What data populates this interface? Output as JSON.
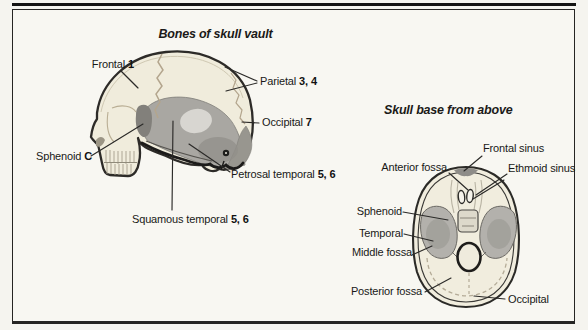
{
  "header": {
    "fragment": "Skull bones"
  },
  "left": {
    "title": "Bones of skull vault",
    "labels": {
      "frontal": {
        "name": "Frontal",
        "num": "1"
      },
      "parietal": {
        "name": "Parietal",
        "num": "3, 4"
      },
      "occipital": {
        "name": "Occipital",
        "num": "7"
      },
      "sphenoid": {
        "name": "Sphenoid",
        "num": "C"
      },
      "petrosal": {
        "name": "Petrosal temporal",
        "num": "5, 6"
      },
      "squamous": {
        "name": "Squamous temporal",
        "num": "5, 6"
      }
    }
  },
  "right": {
    "title": "Skull base from above",
    "labels": {
      "anterior": "Anterior fossa",
      "frontal_sinus": "Frontal sinus",
      "ethmoid": "Ethmoid sinus",
      "sphenoid": "Sphenoid",
      "temporal": "Temporal",
      "middle": "Middle fossa",
      "posterior": "Posterior fossa",
      "occipital": "Occipital"
    }
  },
  "colors": {
    "paper": "#f5f4ef",
    "ink": "#1b1a18",
    "bone_cream": "#f0ecdc",
    "temporal_gray": "#a9a7a2",
    "occipital_gray": "#98968f",
    "fossa_gray": "#b3b1ac",
    "suture_tan": "#b3a58d"
  }
}
